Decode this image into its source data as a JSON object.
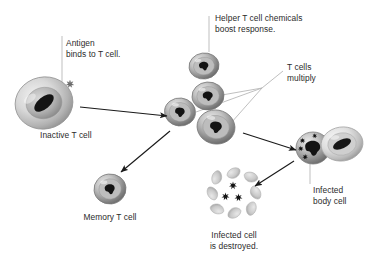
{
  "diagram": {
    "background_color": "#ffffff",
    "text_color": "#2b2b2b",
    "leader_line_color": "#b8b8b8",
    "arrow_color": "#1a1a1a",
    "labels": [
      {
        "id": "antigen",
        "text": "Antigen\nbinds to T cell.",
        "x": 66,
        "y": 38,
        "align": "left"
      },
      {
        "id": "helper",
        "text": "Helper T cell chemicals\nboost response.",
        "x": 215,
        "y": 13,
        "align": "left"
      },
      {
        "id": "multiply",
        "text": "T cells\nmultiply",
        "x": 287,
        "y": 62,
        "align": "left"
      },
      {
        "id": "inactive",
        "text": "Inactive T cell",
        "x": 40,
        "y": 130,
        "align": "left"
      },
      {
        "id": "memory",
        "text": "Memory T cell",
        "x": 110,
        "y": 212,
        "align": "center"
      },
      {
        "id": "destroyed",
        "text": "Infected cell\nis destroyed.",
        "x": 234,
        "y": 230,
        "align": "center"
      },
      {
        "id": "infected",
        "text": "Infected\nbody cell",
        "x": 313,
        "y": 185,
        "align": "left"
      }
    ],
    "cells": [
      {
        "id": "inactive-t-cell",
        "name": "inactive-t-cell",
        "cx": 44,
        "cy": 103,
        "rx": 29,
        "ry": 26,
        "kind": "large-pale",
        "rotate": -12
      },
      {
        "id": "helper-t-cell",
        "name": "helper-t-cell",
        "cx": 204,
        "cy": 66,
        "rx": 15,
        "ry": 13,
        "kind": "standard",
        "rotate": -8
      },
      {
        "id": "t-cell-activated",
        "name": "activated-t-cell",
        "cx": 180,
        "cy": 112,
        "rx": 15.5,
        "ry": 14,
        "kind": "standard",
        "rotate": 6
      },
      {
        "id": "t-cell-clone-1",
        "name": "t-cell-clone",
        "cx": 208,
        "cy": 96,
        "rx": 16,
        "ry": 14,
        "kind": "standard",
        "rotate": -4
      },
      {
        "id": "t-cell-clone-2",
        "name": "t-cell-clone",
        "cx": 216,
        "cy": 127,
        "rx": 19,
        "ry": 17,
        "kind": "standard",
        "rotate": 10
      },
      {
        "id": "memory-t-cell",
        "name": "memory-t-cell",
        "cx": 110,
        "cy": 189,
        "rx": 16,
        "ry": 15,
        "kind": "standard",
        "rotate": -6
      },
      {
        "id": "infected-t-cell",
        "name": "attacking-t-cell",
        "cx": 313,
        "cy": 148,
        "rx": 17,
        "ry": 16,
        "kind": "pathogen-loaded",
        "rotate": 0
      },
      {
        "id": "body-cell",
        "name": "infected-body-cell",
        "cx": 342,
        "cy": 144,
        "rx": 21,
        "ry": 17,
        "kind": "body-cell",
        "rotate": -8
      }
    ],
    "antigen": {
      "name": "antigen-particle",
      "x": 70,
      "y": 84
    },
    "destroyed_cell": {
      "name": "destroyed-infected-cell",
      "cx": 234,
      "cy": 193,
      "fragments": 8,
      "pathogens": 3
    },
    "arrows": [
      {
        "id": "a1",
        "name": "arrow-activation",
        "x1": 80,
        "y1": 107,
        "x2": 167,
        "y2": 116
      },
      {
        "id": "a2",
        "name": "arrow-to-memory",
        "x1": 170,
        "y1": 131,
        "x2": 121,
        "y2": 172
      },
      {
        "id": "a3",
        "name": "arrow-to-infected-cell",
        "x1": 243,
        "y1": 133,
        "x2": 296,
        "y2": 150
      },
      {
        "id": "a4",
        "name": "arrow-to-destroyed-cell",
        "x1": 294,
        "y1": 161,
        "x2": 255,
        "y2": 186
      }
    ],
    "leaders": [
      {
        "id": "l1",
        "name": "leader-antigen",
        "points": "62,36 62,84"
      },
      {
        "id": "l2",
        "name": "leader-helper",
        "points": "209,16 209,52"
      },
      {
        "id": "l3",
        "name": "leader-inactive",
        "points": "36,126 36,106"
      },
      {
        "id": "l4",
        "name": "leader-infected-body-cell",
        "points": "310,184 310,157"
      },
      {
        "id": "l5",
        "name": "leader-multiply-hub",
        "points": "283,71 262,88"
      },
      {
        "id": "l6",
        "name": "leader-multiply-branch-a",
        "points": "262,88 222,95"
      },
      {
        "id": "l7",
        "name": "leader-multiply-branch-b",
        "points": "262,88 196,112"
      },
      {
        "id": "l8",
        "name": "leader-multiply-branch-c",
        "points": "262,88 231,123"
      }
    ]
  }
}
